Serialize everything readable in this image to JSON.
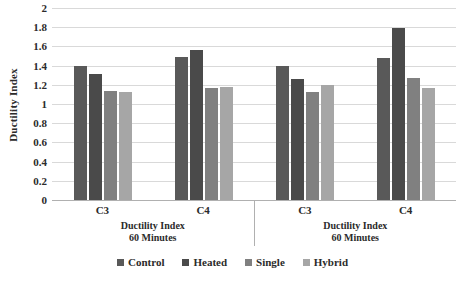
{
  "chart_data": {
    "type": "bar",
    "title": "",
    "xlabel": "Ductility Index 60 Minutes",
    "ylabel": "Ductility Index",
    "ylim": [
      0,
      2
    ],
    "ytick_step": 0.2,
    "yticks": [
      "2",
      "1.8",
      "1.6",
      "1.4",
      "1.2",
      "1",
      "0.8",
      "0.6",
      "0.4",
      "0.2",
      "0"
    ],
    "grid": true,
    "legend_position": "bottom",
    "categories": [
      "C3",
      "C4"
    ],
    "panels": [
      {
        "axis_label_line1": "Ductility Index",
        "axis_label_line2": "60 Minutes",
        "categories": [
          "C3",
          "C4"
        ],
        "series": [
          {
            "name": "Control",
            "values": [
              1.4,
              1.49
            ]
          },
          {
            "name": "Heated",
            "values": [
              1.31,
              1.56
            ]
          },
          {
            "name": "Single",
            "values": [
              1.14,
              1.17
            ]
          },
          {
            "name": "Hybrid",
            "values": [
              1.13,
              1.18
            ]
          }
        ]
      },
      {
        "axis_label_line1": "Ductility Index",
        "axis_label_line2": "60 Minutes",
        "categories": [
          "C3",
          "C4"
        ],
        "series": [
          {
            "name": "Control",
            "values": [
              1.4,
              1.48
            ]
          },
          {
            "name": "Heated",
            "values": [
              1.26,
              1.79
            ]
          },
          {
            "name": "Single",
            "values": [
              1.13,
              1.27
            ]
          },
          {
            "name": "Hybrid",
            "values": [
              1.2,
              1.17
            ]
          }
        ]
      }
    ],
    "legend": [
      {
        "label": "Control",
        "color": "#595959"
      },
      {
        "label": "Heated",
        "color": "#4a4a4a"
      },
      {
        "label": "Single",
        "color": "#808080"
      },
      {
        "label": "Hybrid",
        "color": "#a6a6a6"
      }
    ],
    "series_colors": [
      "#595959",
      "#4a4a4a",
      "#808080",
      "#a6a6a6"
    ],
    "grid_color": "#d9d9d9",
    "axis_color": "#b0b0b0"
  }
}
